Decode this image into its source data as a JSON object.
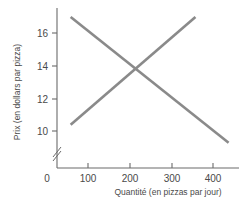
{
  "chart_data": {
    "type": "line",
    "title": "",
    "xlabel": "Quantité (en pizzas par jour)",
    "ylabel": "Prix (en dollars par pizza)",
    "xlim": [
      0,
      460
    ],
    "ylim": [
      9,
      17.5
    ],
    "y_axis_break": true,
    "grid": false,
    "legend": false,
    "xticks": [
      0,
      100,
      200,
      300,
      400
    ],
    "xticklabels": [
      "0",
      "100",
      "200",
      "300",
      "400"
    ],
    "yticks": [
      10,
      12,
      14,
      16
    ],
    "yticklabels": [
      "10",
      "12",
      "14",
      "16"
    ],
    "line_color": "#8a8a8a",
    "axis_color": "#6b6b6b",
    "series": [
      {
        "name": "demande",
        "x": [
          35,
          440
        ],
        "y": [
          17.0,
          9.3
        ]
      },
      {
        "name": "offre",
        "x": [
          35,
          355
        ],
        "y": [
          10.4,
          17.0
        ]
      }
    ],
    "equilibrium": {
      "x": 200,
      "y": 14
    }
  },
  "axes": {
    "y_title": "Prix (en dollars par pizza)",
    "x_title": "Quantité (en pizzas par jour)",
    "origin_label": "0",
    "y_tick_labels": [
      "16",
      "14",
      "12",
      "10"
    ],
    "x_tick_labels": [
      "100",
      "200",
      "300",
      "400"
    ]
  }
}
